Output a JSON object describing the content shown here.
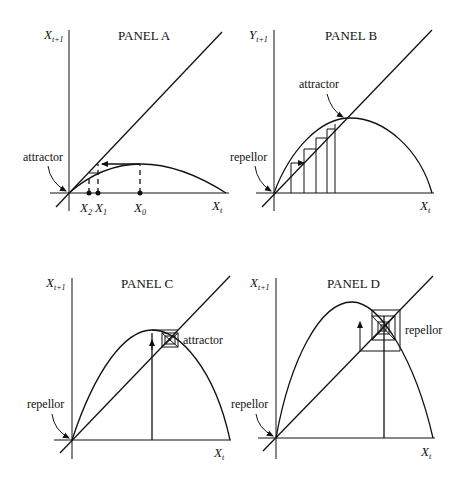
{
  "figure": {
    "panels": [
      {
        "id": "A",
        "title": "PANEL A",
        "y_axis_label": "X",
        "y_axis_sub": "t+1",
        "x_axis_label": "X",
        "x_axis_sub": "t",
        "annotations": [
          "attractor"
        ],
        "iterates": [
          {
            "label": "X",
            "sub": "2"
          },
          {
            "label": "X",
            "sub": "1"
          },
          {
            "label": "X",
            "sub": "0"
          }
        ]
      },
      {
        "id": "B",
        "title": "PANEL B",
        "y_axis_label": "Y",
        "y_axis_sub": "t+1",
        "x_axis_label": "X",
        "x_axis_sub": "t",
        "annotations": [
          "attractor",
          "repellor"
        ]
      },
      {
        "id": "C",
        "title": "PANEL C",
        "y_axis_label": "X",
        "y_axis_sub": "t+1",
        "x_axis_label": "X",
        "x_axis_sub": "t",
        "annotations": [
          "attractor",
          "repellor"
        ]
      },
      {
        "id": "D",
        "title": "PANEL D",
        "y_axis_label": "X",
        "y_axis_sub": "t+1",
        "x_axis_label": "X",
        "x_axis_sub": "t",
        "annotations": [
          "repellor",
          "repellor"
        ]
      }
    ]
  }
}
